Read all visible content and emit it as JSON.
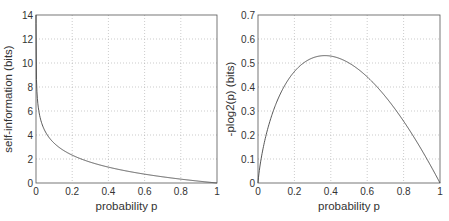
{
  "chart_data": [
    {
      "type": "line",
      "title": "",
      "xlabel": "probability p",
      "ylabel": "self-information (bits)",
      "xlim": [
        0,
        1
      ],
      "ylim": [
        0,
        14
      ],
      "xticks": [
        "0",
        "0.2",
        "0.4",
        "0.6",
        "0.8",
        "1"
      ],
      "yticks": [
        "0",
        "2",
        "4",
        "6",
        "8",
        "10",
        "12",
        "14"
      ],
      "grid": true,
      "legend": null,
      "series": [
        {
          "name": "-log2(p)",
          "x": [
            0.0001,
            0.001,
            0.005,
            0.01,
            0.02,
            0.05,
            0.1,
            0.2,
            0.3,
            0.4,
            0.5,
            0.6,
            0.7,
            0.8,
            0.9,
            1.0
          ],
          "y": [
            13.29,
            9.97,
            7.64,
            6.64,
            5.64,
            4.32,
            3.32,
            2.32,
            1.74,
            1.32,
            1.0,
            0.74,
            0.51,
            0.32,
            0.15,
            0.0
          ]
        }
      ]
    },
    {
      "type": "line",
      "title": "",
      "xlabel": "probability p",
      "ylabel": "-plog2(p) (bits)",
      "xlim": [
        0,
        1
      ],
      "ylim": [
        0,
        0.7
      ],
      "xticks": [
        "0",
        "0.2",
        "0.4",
        "0.6",
        "0.8",
        "1"
      ],
      "yticks": [
        "0",
        "0.1",
        "0.2",
        "0.3",
        "0.4",
        "0.5",
        "0.6",
        "0.7"
      ],
      "grid": true,
      "legend": null,
      "series": [
        {
          "name": "-p*log2(p)",
          "x": [
            0.0,
            0.01,
            0.05,
            0.1,
            0.15,
            0.2,
            0.25,
            0.3,
            0.35,
            0.368,
            0.4,
            0.5,
            0.6,
            0.7,
            0.8,
            0.9,
            1.0
          ],
          "y": [
            0.0,
            0.066,
            0.216,
            0.332,
            0.411,
            0.464,
            0.5,
            0.521,
            0.53,
            0.531,
            0.529,
            0.5,
            0.442,
            0.36,
            0.258,
            0.137,
            0.0
          ]
        }
      ]
    }
  ]
}
